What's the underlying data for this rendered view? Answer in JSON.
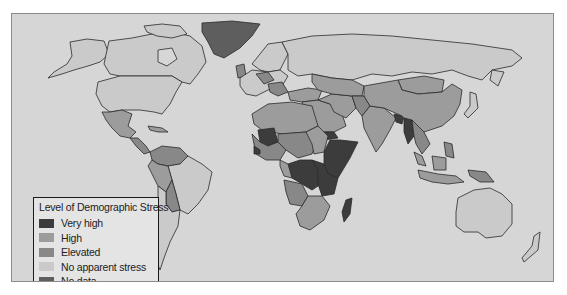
{
  "map": {
    "title": "World map of demographic stress by country",
    "background_color": "#d6d6d6",
    "border_color": "#8c8c8c"
  },
  "legend": {
    "title": "Level of Demographic Stress",
    "items": [
      {
        "label": "Very high",
        "color": "#3c3c3c"
      },
      {
        "label": "High",
        "color": "#9c9c9c"
      },
      {
        "label": "Elevated",
        "color": "#888888"
      },
      {
        "label": "No apparent stress",
        "color": "#cacaca"
      },
      {
        "label": "No data",
        "color": "#5e5e5e"
      }
    ]
  },
  "regions": {
    "very_high": [
      "Mali",
      "Guinea",
      "Sierra Leone",
      "Ethiopia",
      "Somalia",
      "Kenya",
      "Yemen",
      "DR Congo",
      "Uganda",
      "Tanzania",
      "Madagascar",
      "Afghanistan",
      "Bangladesh",
      "Myanmar"
    ],
    "high": [
      "Mexico",
      "Central America",
      "Peru",
      "Bolivia",
      "Brazil north",
      "North Africa",
      "Middle East",
      "India",
      "China",
      "Southeast Asia",
      "Indonesia",
      "Southern Africa"
    ],
    "elevated": [
      "Colombia",
      "Venezuela",
      "Sahel",
      "West Africa",
      "Angola",
      "Pakistan",
      "Papua New Guinea"
    ],
    "no_apparent_stress": [
      "Canada",
      "United States",
      "Argentina",
      "Chile",
      "Russia",
      "Western Europe",
      "Japan",
      "Australia",
      "New Zealand"
    ],
    "no_data": [
      "Greenland"
    ]
  }
}
